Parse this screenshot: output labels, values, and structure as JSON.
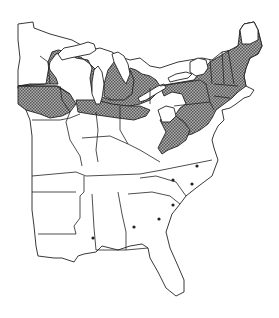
{
  "map": {
    "title": "",
    "region": "Eastern United States",
    "legend": [],
    "shaded_region": {
      "description": "Distribution range (cross-hatched)",
      "fill_color": "#8a8a8a",
      "pattern": "cross-hatch"
    },
    "point_records": {
      "description": "Isolated occurrence dots in southeastern states",
      "count": 7
    },
    "colors": {
      "outline": "#222222",
      "background": "#ffffff",
      "shading": "#8a8a8a"
    }
  }
}
